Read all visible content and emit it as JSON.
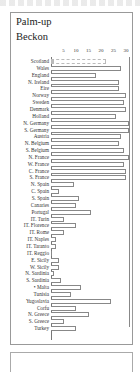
{
  "chart_data": {
    "type": "bar",
    "orientation": "horizontal",
    "title": "Palm-up Beckon",
    "title_lines": [
      "Palm-up",
      "Beckon"
    ],
    "xlabel": "",
    "ylabel": "",
    "xlim": [
      0,
      31
    ],
    "xticks": [
      "5",
      "10",
      "15",
      "20",
      "25",
      "30"
    ],
    "grid": false,
    "legend": null,
    "categories": [
      "Scotland",
      "Wales",
      "England",
      "N. Ireland",
      "Eire",
      "Norway",
      "Sweden",
      "Denmark",
      "Holland",
      "N. Germany",
      "S. Germany",
      "Austria",
      "N. Belgium",
      "S. Belgium",
      "N. France",
      "W. France",
      "C. France",
      "S. France",
      "N. Spain",
      "C. Spain",
      "S. Spain",
      "Canaries",
      "Portugal",
      "IT. Turin",
      "IT. Florence",
      "IT. Rome",
      "IT. Naples",
      "IT. Taranto",
      "IT. Reggio",
      "E. Sicily",
      "W. Sicily",
      "N. Sardinia",
      "S. Sardinia",
      "Malta",
      "Tunisia",
      "Yugoslavia",
      "Corfu",
      "N. Greece",
      "S. Greece",
      "Turkey"
    ],
    "values": [
      22,
      28,
      18,
      27,
      27,
      30,
      29,
      30,
      26,
      31,
      31,
      28,
      27,
      29,
      31,
      29,
      30,
      30,
      9,
      3,
      11,
      10,
      16,
      5,
      10,
      5,
      2,
      2,
      0,
      3,
      3,
      1,
      4,
      12,
      8,
      24,
      10,
      15,
      5,
      10
    ],
    "annotations": [
      {
        "category": "Malta",
        "marker": "•"
      }
    ]
  }
}
